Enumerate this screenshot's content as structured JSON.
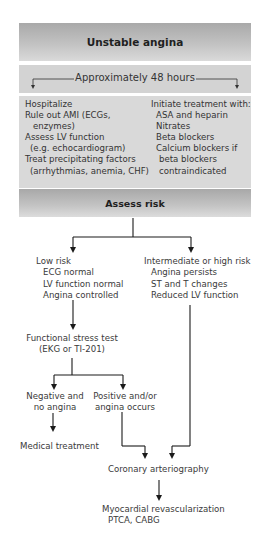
{
  "diagram": {
    "title": "Unstable angina",
    "timeframe": "Approximately 48 hours",
    "initial_actions": {
      "left": [
        {
          "text": "Hospitalize",
          "indent": false
        },
        {
          "text": "Rule out AMI (ECGs,",
          "indent": false
        },
        {
          "text": "enzymes)",
          "indent": true
        },
        {
          "text": "Assess LV function",
          "indent": false
        },
        {
          "text": "(e.g. echocardiogram)",
          "indent": true
        },
        {
          "text": "Treat precipitating factors",
          "indent": false
        },
        {
          "text": "(arrhythmias, anemia, CHF)",
          "indent": true
        }
      ],
      "right": [
        {
          "text": "Initiate treatment with:",
          "indent": false
        },
        {
          "text": "ASA and heparin",
          "indent": true
        },
        {
          "text": "Nitrates",
          "indent": true
        },
        {
          "text": "Beta blockers",
          "indent": true
        },
        {
          "text": "Calcium blockers if",
          "indent": true
        },
        {
          "text": "beta blockers",
          "indent": true
        },
        {
          "text": "contraindicated",
          "indent": true
        }
      ]
    },
    "assess": "Assess risk",
    "low_risk": {
      "heading": "Low risk",
      "items": [
        "ECG normal",
        "LV function normal",
        "Angina controlled"
      ]
    },
    "high_risk": {
      "heading": "Intermediate or high risk",
      "items": [
        "Angina persists",
        "ST and T changes",
        "Reduced LV function"
      ]
    },
    "stress_test": {
      "line1": "Functional stress test",
      "line2": "(EKG or TI-201)"
    },
    "negative": {
      "line1": "Negative and",
      "line2": "no angina"
    },
    "positive": {
      "line1": "Positive and/or",
      "line2": "angina occurs"
    },
    "medical_treatment": "Medical treatment",
    "arteriography": "Coronary arteriography",
    "revascularization": {
      "line1": "Myocardial revascularization",
      "line2": "PTCA, CABG"
    },
    "colors": {
      "box_dark": "#a9a9a9",
      "box_light": "#d9d9d9",
      "line": "#1a1a1a",
      "text": "#333333"
    }
  }
}
